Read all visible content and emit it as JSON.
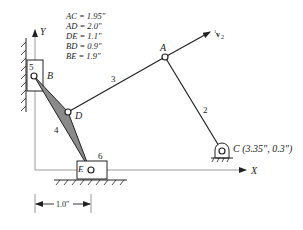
{
  "dimensions": {
    "title": "Link lengths",
    "items": [
      {
        "label": "AC = 1.95\""
      },
      {
        "label": "AD = 2.0\""
      },
      {
        "label": "DE = 1.1\""
      },
      {
        "label": "BD = 0.9\""
      },
      {
        "label": "BE = 1.9\""
      }
    ]
  },
  "axes": {
    "x_label": "X",
    "y_label": "Y"
  },
  "points": {
    "A": "A",
    "B": "B",
    "C": "C (3.35\", 0.3\")",
    "D": "D",
    "E": "E"
  },
  "links": {
    "l2": "2",
    "l3": "3",
    "l4": "4",
    "l5": "5",
    "l6": "6"
  },
  "velocity": {
    "label_sup": "1",
    "label_main": "v",
    "label_sub": "2"
  },
  "dimension_line": {
    "label": "1.0\""
  },
  "colors": {
    "line": "#222222",
    "link4_fill": "#8a8a8a",
    "axis": "#9a9a9a"
  }
}
